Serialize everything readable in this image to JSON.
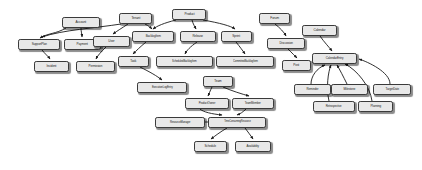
{
  "diagram": {
    "type": "uml-class-diagram",
    "background_color": "#ffffff",
    "node_fill_color": "#e8e8e8",
    "node_border_color": "#3a3a3a",
    "edge_color": "#1a1a1a",
    "width": 422,
    "height": 170,
    "nodes": [
      {
        "id": "account",
        "label": "Account",
        "x": 62,
        "y": 17,
        "w": 38,
        "h": 11,
        "font": 3.4
      },
      {
        "id": "tenant",
        "label": "Tenant",
        "x": 119,
        "y": 13,
        "w": 33,
        "h": 11,
        "font": 3.4
      },
      {
        "id": "product",
        "label": "Product",
        "x": 172,
        "y": 9,
        "w": 34,
        "h": 11,
        "font": 3.4
      },
      {
        "id": "forum",
        "label": "Forum",
        "x": 259,
        "y": 13,
        "w": 31,
        "h": 11,
        "font": 3.4
      },
      {
        "id": "calendar",
        "label": "Calendar",
        "x": 302,
        "y": 25,
        "w": 35,
        "h": 11,
        "font": 3.4
      },
      {
        "id": "support-plan",
        "label": "SupportPlan",
        "x": 18,
        "y": 39,
        "w": 42,
        "h": 11,
        "font": 3.2
      },
      {
        "id": "payment",
        "label": "Payment",
        "x": 64,
        "y": 39,
        "w": 37,
        "h": 11,
        "font": 3.3
      },
      {
        "id": "user",
        "label": "User",
        "x": 93,
        "y": 36,
        "w": 37,
        "h": 11,
        "font": 3.4
      },
      {
        "id": "backlog-item",
        "label": "BacklogItem",
        "x": 132,
        "y": 31,
        "w": 42,
        "h": 11,
        "font": 3.2
      },
      {
        "id": "release",
        "label": "Release",
        "x": 180,
        "y": 31,
        "w": 36,
        "h": 11,
        "font": 3.3
      },
      {
        "id": "sprint",
        "label": "Sprint",
        "x": 221,
        "y": 31,
        "w": 31,
        "h": 11,
        "font": 3.4
      },
      {
        "id": "discussion",
        "label": "Discussion",
        "x": 267,
        "y": 38,
        "w": 38,
        "h": 11,
        "font": 3.2
      },
      {
        "id": "calendar-entry",
        "label": "CalendarEntry",
        "x": 312,
        "y": 53,
        "w": 45,
        "h": 11,
        "font": 3.2
      },
      {
        "id": "incident",
        "label": "Incident",
        "x": 34,
        "y": 61,
        "w": 35,
        "h": 11,
        "font": 3.3
      },
      {
        "id": "permission",
        "label": "Permission",
        "x": 76,
        "y": 61,
        "w": 39,
        "h": 11,
        "font": 3.2
      },
      {
        "id": "task",
        "label": "Task",
        "x": 118,
        "y": 56,
        "w": 31,
        "h": 11,
        "font": 3.4
      },
      {
        "id": "scheduled-backlog-item",
        "label": "ScheduledBacklogItem",
        "x": 156,
        "y": 56,
        "w": 57,
        "h": 11,
        "font": 2.8
      },
      {
        "id": "committed-backlog-item",
        "label": "CommittedBacklogItem",
        "x": 216,
        "y": 56,
        "w": 58,
        "h": 11,
        "font": 2.8
      },
      {
        "id": "post",
        "label": "Post",
        "x": 282,
        "y": 60,
        "w": 29,
        "h": 11,
        "font": 3.4
      },
      {
        "id": "execution-log-entry",
        "label": "ExecutionLogEntry",
        "x": 137,
        "y": 82,
        "w": 50,
        "h": 11,
        "font": 2.9
      },
      {
        "id": "team",
        "label": "Team",
        "x": 203,
        "y": 76,
        "w": 30,
        "h": 11,
        "font": 3.4
      },
      {
        "id": "reminder",
        "label": "Reminder",
        "x": 294,
        "y": 84,
        "w": 37,
        "h": 11,
        "font": 3.2
      },
      {
        "id": "milestone",
        "label": "Milestone",
        "x": 331,
        "y": 84,
        "w": 37,
        "h": 11,
        "font": 3.2
      },
      {
        "id": "target-date",
        "label": "TargetDate",
        "x": 373,
        "y": 84,
        "w": 38,
        "h": 11,
        "font": 3.2
      },
      {
        "id": "product-owner",
        "label": "ProductOwner",
        "x": 185,
        "y": 98,
        "w": 44,
        "h": 11,
        "font": 3.0
      },
      {
        "id": "team-member",
        "label": "TeamMember",
        "x": 232,
        "y": 98,
        "w": 42,
        "h": 11,
        "font": 3.0
      },
      {
        "id": "retrospective",
        "label": "Retrospective",
        "x": 313,
        "y": 101,
        "w": 42,
        "h": 11,
        "font": 3.0
      },
      {
        "id": "planning",
        "label": "Planning",
        "x": 358,
        "y": 101,
        "w": 35,
        "h": 11,
        "font": 3.2
      },
      {
        "id": "resource-manager",
        "label": "ResourceManager",
        "x": 155,
        "y": 117,
        "w": 50,
        "h": 11,
        "font": 2.9
      },
      {
        "id": "time-consuming-resource",
        "label": "TimeConsumingResource",
        "x": 208,
        "y": 117,
        "w": 58,
        "h": 11,
        "font": 2.7
      },
      {
        "id": "schedule",
        "label": "Schedule",
        "x": 194,
        "y": 141,
        "w": 33,
        "h": 11,
        "font": 3.2
      },
      {
        "id": "availability",
        "label": "Availability",
        "x": 235,
        "y": 141,
        "w": 36,
        "h": 11,
        "font": 3.1
      }
    ],
    "edges": [
      {
        "id": "account-support-plan",
        "from": "account",
        "to": "support-plan",
        "path": "M 66 28 C 56 34 48 33 40 38"
      },
      {
        "id": "account-payment",
        "from": "account",
        "to": "payment",
        "path": "M 81 28 C 81 32 82 34 82 37"
      },
      {
        "id": "tenant-support-plan",
        "from": "tenant",
        "to": "support-plan",
        "path": "M 121 24 C 96 28 62 30 42 37"
      },
      {
        "id": "tenant-user",
        "from": "tenant",
        "to": "user",
        "path": "M 128 24 C 122 28 117 31 113 34"
      },
      {
        "id": "tenant-backlog-item",
        "from": "tenant",
        "to": "backlog-item",
        "path": "M 145 24 C 149 26 151 28 152 29"
      },
      {
        "id": "support-plan-incident",
        "from": "support-plan",
        "to": "incident",
        "path": "M 42 50 C 45 54 48 56 50 59"
      },
      {
        "id": "user-permission",
        "from": "user",
        "to": "permission",
        "path": "M 106 47 C 101 52 98 55 96 59"
      },
      {
        "id": "product-backlog-item",
        "from": "product",
        "to": "backlog-item",
        "path": "M 176 20 C 164 23 157 26 153 29"
      },
      {
        "id": "product-release",
        "from": "product",
        "to": "release",
        "path": "M 192 20 C 193 24 195 27 196 29"
      },
      {
        "id": "product-sprint",
        "from": "product",
        "to": "sprint",
        "path": "M 203 20 C 220 23 231 26 235 29"
      },
      {
        "id": "backlog-item-task",
        "from": "backlog-item",
        "to": "task",
        "path": "M 146 42 C 140 47 136 51 133 54"
      },
      {
        "id": "release-scheduled",
        "from": "release",
        "to": "scheduled-backlog-item",
        "path": "M 197 42 C 190 47 187 50 185 54"
      },
      {
        "id": "sprint-committed",
        "from": "sprint",
        "to": "committed-backlog-item",
        "path": "M 236 42 C 240 47 243 51 245 54"
      },
      {
        "id": "task-execution-log",
        "from": "task",
        "to": "execution-log-entry",
        "path": "M 140 67 C 150 72 157 76 162 80"
      },
      {
        "id": "forum-discussion",
        "from": "forum",
        "to": "discussion",
        "path": "M 275 24 C 280 28 284 32 286 36"
      },
      {
        "id": "discussion-post",
        "from": "discussion",
        "to": "post",
        "path": "M 288 49 C 292 53 295 56 297 58"
      },
      {
        "id": "calendar-calendar-entry",
        "from": "calendar",
        "to": "calendar-entry",
        "path": "M 320 36 C 324 42 329 47 332 51"
      },
      {
        "id": "reminder-calendar-entry",
        "from": "reminder",
        "to": "calendar-entry",
        "path": "M 311 84 C 311 76 317 68 325 65"
      },
      {
        "id": "milestone-calendar-entry",
        "from": "milestone",
        "to": "calendar-entry",
        "path": "M 347 84 C 343 76 340 70 337 65"
      },
      {
        "id": "target-calendar-entry",
        "from": "target-date",
        "to": "calendar-entry",
        "path": "M 390 84 C 390 72 368 62 359 59"
      },
      {
        "id": "retro-calendar-entry",
        "from": "retrospective",
        "to": "calendar-entry",
        "path": "M 329 101 C 326 88 328 72 331 65"
      },
      {
        "id": "planning-calendar-entry",
        "from": "planning",
        "to": "calendar-entry",
        "path": "M 372 101 C 370 86 357 70 345 64"
      },
      {
        "id": "team-product-owner",
        "from": "team",
        "to": "product-owner",
        "path": "M 212 87 C 210 91 209 94 208 96"
      },
      {
        "id": "team-team-member",
        "from": "team",
        "to": "team-member",
        "path": "M 223 87 C 232 91 242 94 249 96"
      },
      {
        "id": "product-owner-tcr",
        "from": "product-owner",
        "to": "time-consuming-resource",
        "path": "M 200 109 C 203 112 212 114 222 115"
      },
      {
        "id": "team-member-tcr",
        "from": "team-member",
        "to": "time-consuming-resource",
        "path": "M 246 109 C 243 112 240 114 237 115"
      },
      {
        "id": "resource-manager-tcr",
        "from": "resource-manager",
        "to": "time-consuming-resource",
        "path": "M 205 122 C 212 122 218 122 225 122"
      },
      {
        "id": "tcr-schedule",
        "from": "time-consuming-resource",
        "to": "schedule",
        "path": "M 227 128 C 220 132 215 136 211 139"
      },
      {
        "id": "tcr-availability",
        "from": "time-consuming-resource",
        "to": "availability",
        "path": "M 245 128 C 248 132 251 136 253 139"
      }
    ]
  }
}
